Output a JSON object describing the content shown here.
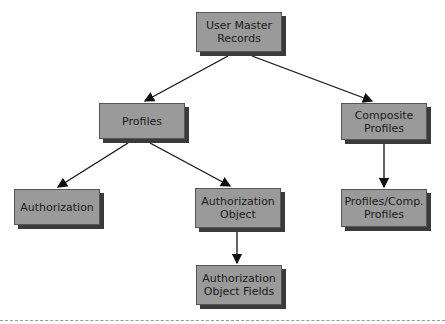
{
  "diagram": {
    "nodes": [
      {
        "id": "user-master-records",
        "label": "User Master Records",
        "x": 196,
        "y": 12,
        "w": 86,
        "h": 40
      },
      {
        "id": "profiles",
        "label": "Profiles",
        "x": 99,
        "y": 103,
        "w": 86,
        "h": 36
      },
      {
        "id": "composite-profiles",
        "label": "Composite Profiles",
        "x": 341,
        "y": 103,
        "w": 86,
        "h": 37
      },
      {
        "id": "authorization",
        "label": "Authorization",
        "x": 14,
        "y": 189,
        "w": 86,
        "h": 36
      },
      {
        "id": "authorization-object",
        "label": "Authorization Object",
        "x": 195,
        "y": 188,
        "w": 86,
        "h": 40
      },
      {
        "id": "profiles-comp-profiles",
        "label": "Profiles/Comp. Profiles",
        "x": 341,
        "y": 189,
        "w": 86,
        "h": 38
      },
      {
        "id": "authorization-object-fields",
        "label": "Authorization Object Fields",
        "x": 196,
        "y": 265,
        "w": 86,
        "h": 40
      }
    ],
    "edges": [
      {
        "from": "user-master-records",
        "to": "profiles",
        "x1": 228,
        "y1": 56,
        "x2": 145,
        "y2": 101
      },
      {
        "from": "user-master-records",
        "to": "composite-profiles",
        "x1": 252,
        "y1": 56,
        "x2": 372,
        "y2": 101
      },
      {
        "from": "profiles",
        "to": "authorization",
        "x1": 128,
        "y1": 143,
        "x2": 58,
        "y2": 187
      },
      {
        "from": "profiles",
        "to": "authorization-object",
        "x1": 150,
        "y1": 143,
        "x2": 230,
        "y2": 186
      },
      {
        "from": "composite-profiles",
        "to": "profiles-comp-profiles",
        "x1": 384,
        "y1": 144,
        "x2": 384,
        "y2": 187
      },
      {
        "from": "authorization-object",
        "to": "authorization-object-fields",
        "x1": 237,
        "y1": 232,
        "x2": 237,
        "y2": 263
      }
    ],
    "colors": {
      "box_fill": "#9a9a9a",
      "box_shadow": "#3a3a3a",
      "edge": "#111111",
      "divider": "#999999"
    }
  }
}
